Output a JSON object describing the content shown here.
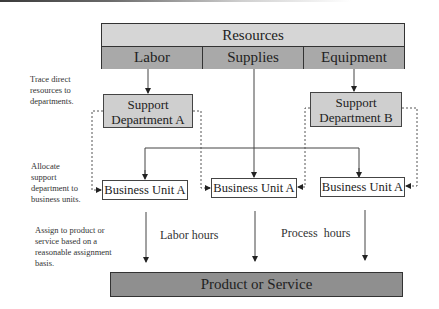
{
  "resources": {
    "title": "Resources",
    "items": [
      "Labor",
      "Supplies",
      "Equipment"
    ]
  },
  "support_departments": [
    {
      "label": "Support Department A"
    },
    {
      "label": "Support Department B"
    }
  ],
  "business_units": [
    {
      "label": "Business Unit A"
    },
    {
      "label": "Business Unit A"
    },
    {
      "label": "Business Unit A"
    }
  ],
  "product": {
    "label": "Product or Service"
  },
  "notes": {
    "trace": "Trace direct resources to departments.",
    "allocate": "Allocate support department to business units.",
    "assign": "Assign to product or service based on a reasonable assignment basis."
  },
  "bases": {
    "labor": "Labor hours",
    "process": "Process  hours"
  },
  "colors": {
    "resources_title_bg": "#d6d6d6",
    "resources_items_bg": "#a9a9a9",
    "department_bg": "#cfcfcf",
    "product_bg": "#8f8f8f"
  }
}
